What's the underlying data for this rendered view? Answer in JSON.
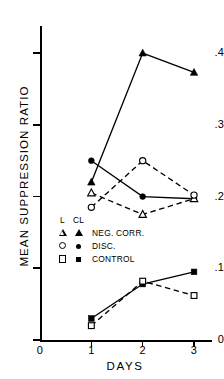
{
  "chart_data": {
    "type": "line",
    "title": "",
    "xlabel": "DAYS",
    "ylabel": "MEAN SUPPRESSION RATIO",
    "x": [
      1,
      2,
      3
    ],
    "xlim": [
      0,
      3.35
    ],
    "ylim": [
      0,
      0.435
    ],
    "x_ticks": [
      "0",
      "1",
      "2",
      "3"
    ],
    "x_tick_values": [
      0,
      1,
      2,
      3
    ],
    "y_ticks": [
      "0",
      ".1",
      ".2",
      ".3",
      ".4"
    ],
    "y_tick_values": [
      0,
      0.1,
      0.2,
      0.3,
      0.4
    ],
    "grid": false,
    "legend_position": "inside-lower-left",
    "series": [
      {
        "name": "CL NEG. CORR.",
        "group": "CL",
        "condition": "NEG. CORR.",
        "marker": "triangle-filled",
        "line": "solid",
        "values": [
          0.22,
          0.4,
          0.373
        ]
      },
      {
        "name": "CL DISC.",
        "group": "CL",
        "condition": "DISC.",
        "marker": "circle-filled",
        "line": "solid",
        "values": [
          0.25,
          0.2,
          0.197
        ]
      },
      {
        "name": "CL CONTROL",
        "group": "CL",
        "condition": "CONTROL",
        "marker": "square-filled",
        "line": "solid",
        "values": [
          0.03,
          0.078,
          0.095
        ]
      },
      {
        "name": "L NEG. CORR.",
        "group": "L",
        "condition": "NEG. CORR.",
        "marker": "triangle-open",
        "line": "dashed",
        "values": [
          0.205,
          0.175,
          0.197
        ]
      },
      {
        "name": "L DISC.",
        "group": "L",
        "condition": "DISC.",
        "marker": "circle-open",
        "line": "dashed",
        "values": [
          0.185,
          0.25,
          0.202
        ]
      },
      {
        "name": "L CONTROL",
        "group": "L",
        "condition": "CONTROL",
        "marker": "square-open",
        "line": "dashed",
        "values": [
          0.02,
          0.082,
          0.062
        ]
      }
    ]
  },
  "legend": {
    "headers": [
      "L",
      "CL"
    ],
    "rows": [
      {
        "open": "triangle-open",
        "filled": "triangle-filled",
        "label": "NEG. CORR."
      },
      {
        "open": "circle-open",
        "filled": "circle-filled",
        "label": "DISC."
      },
      {
        "open": "square-open",
        "filled": "square-filled",
        "label": "CONTROL"
      }
    ]
  },
  "colors": {
    "ink": "#000000",
    "background": "#ffffff"
  }
}
